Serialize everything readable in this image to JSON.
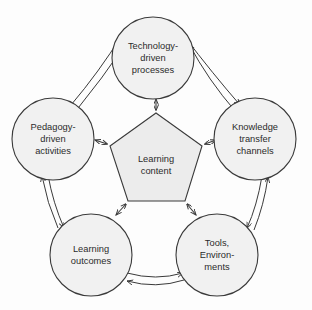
{
  "diagram": {
    "type": "cycle-pentagon",
    "background_color": "#fdfdfd",
    "node_fill_color": "#f1f1f1",
    "center_fill_color": "#ececec",
    "stroke_color": "#3a3a3a",
    "text_color": "#2b2b2b",
    "center": {
      "name": "learning-content",
      "lines": [
        "Learning",
        "content"
      ],
      "shape": "pentagon"
    },
    "nodes": [
      {
        "name": "technology-driven-processes",
        "position": "top",
        "lines": [
          "Technology-",
          "driven",
          "processes"
        ]
      },
      {
        "name": "knowledge-transfer-channels",
        "position": "right",
        "lines": [
          "Knowledge",
          "transfer",
          "channels"
        ]
      },
      {
        "name": "tools-environments",
        "position": "bottom-right",
        "lines": [
          "Tools,",
          "Environ-",
          "ments"
        ]
      },
      {
        "name": "learning-outcomes",
        "position": "bottom-left",
        "lines": [
          "Learning",
          "outcomes"
        ]
      },
      {
        "name": "pedagogy-driven-activities",
        "position": "left",
        "lines": [
          "Pedagogy-",
          "driven",
          "activities"
        ]
      }
    ],
    "spokes": [
      {
        "name": "spoke-center-to-technology",
        "from": "learning-content",
        "to": "technology-driven-processes",
        "arrow": "double"
      },
      {
        "name": "spoke-center-to-knowledge",
        "from": "learning-content",
        "to": "knowledge-transfer-channels",
        "arrow": "double"
      },
      {
        "name": "spoke-center-to-tools",
        "from": "learning-content",
        "to": "tools-environments",
        "arrow": "double"
      },
      {
        "name": "spoke-center-to-outcomes",
        "from": "learning-content",
        "to": "learning-outcomes",
        "arrow": "double"
      },
      {
        "name": "spoke-center-to-pedagogy",
        "from": "learning-content",
        "to": "pedagogy-driven-activities",
        "arrow": "double"
      }
    ],
    "ring_connections": [
      {
        "name": "ring-technology-knowledge",
        "from": "technology-driven-processes",
        "to": "knowledge-transfer-channels",
        "arrow": "bidirectional-pair"
      },
      {
        "name": "ring-knowledge-tools",
        "from": "knowledge-transfer-channels",
        "to": "tools-environments",
        "arrow": "bidirectional-pair"
      },
      {
        "name": "ring-tools-outcomes",
        "from": "tools-environments",
        "to": "learning-outcomes",
        "arrow": "bidirectional-pair"
      },
      {
        "name": "ring-outcomes-pedagogy",
        "from": "learning-outcomes",
        "to": "pedagogy-driven-activities",
        "arrow": "bidirectional-pair"
      },
      {
        "name": "ring-pedagogy-technology",
        "from": "pedagogy-driven-activities",
        "to": "technology-driven-processes",
        "arrow": "bidirectional-pair"
      }
    ]
  }
}
